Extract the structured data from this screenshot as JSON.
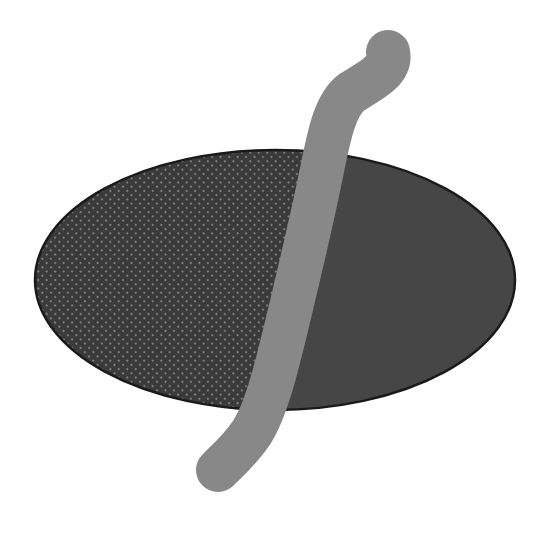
{
  "canvas": {
    "width": 550,
    "height": 538,
    "background": "#ffffff"
  },
  "ellipse": {
    "cx": 275,
    "cy": 280,
    "rx": 240,
    "ry": 130,
    "outline_color": "#1a1a1a",
    "left_fill": "#3a3a3a",
    "left_dot_color": "#8a8a8a",
    "right_fill": "#464646"
  },
  "stroke": {
    "color": "#888888",
    "width": 44,
    "path": "M 388 52 C 392 70, 372 80, 352 92 C 336 104, 330 130, 322 170 C 312 220, 300 270, 288 320 C 276 370, 266 410, 252 432 C 240 450, 226 462, 218 470"
  },
  "divider_path": "M 388 52 C 392 70, 372 80, 352 92 C 336 104, 330 130, 322 170 C 312 220, 300 270, 288 320 C 276 370, 266 410, 252 432 C 240 450, 226 462, 218 470"
}
